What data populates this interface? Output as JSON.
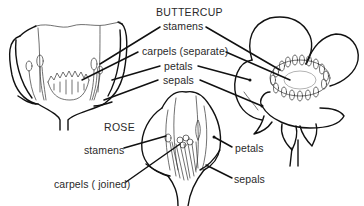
{
  "diagram": {
    "buttercup": {
      "title": "BUTTERCUP",
      "labels": {
        "stamens": "stamens",
        "carpels": "carpels (separate)",
        "petals": "petals",
        "sepals": "sepals"
      }
    },
    "rose": {
      "title": "ROSE",
      "labels": {
        "stamens": "stamens",
        "carpels": "carpels ( joined)",
        "petals": "petals",
        "sepals": "sepals"
      }
    }
  }
}
